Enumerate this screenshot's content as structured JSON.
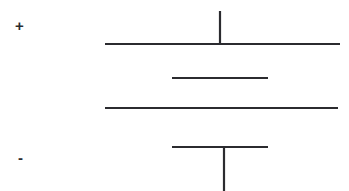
{
  "canvas": {
    "width": 349,
    "height": 191,
    "background_color": "#ffffff"
  },
  "diagram": {
    "stroke_color": "#2b2b2f",
    "labels": {
      "positive_terminal": "+",
      "negative_terminal": "-"
    }
  },
  "chart_data": {
    "type": "diagram",
    "title": "",
    "elements": [
      {
        "name": "top-lead-wire",
        "kind": "line",
        "orientation": "vertical",
        "x1": 220,
        "y1": 11,
        "x2": 220,
        "y2": 45,
        "stroke_width": 2.2,
        "color": "#2b2b2f"
      },
      {
        "name": "plate-long-upper",
        "kind": "line",
        "orientation": "horizontal",
        "x1": 105,
        "y1": 44,
        "x2": 340,
        "y2": 44,
        "stroke_width": 2.2,
        "color": "#2b2b2f"
      },
      {
        "name": "plate-short-upper",
        "kind": "line",
        "orientation": "horizontal",
        "x1": 172,
        "y1": 78,
        "x2": 268,
        "y2": 78,
        "stroke_width": 2.2,
        "color": "#2b2b2f"
      },
      {
        "name": "plate-long-lower",
        "kind": "line",
        "orientation": "horizontal",
        "x1": 105,
        "y1": 108,
        "x2": 338,
        "y2": 108,
        "stroke_width": 2.2,
        "color": "#2b2b2f"
      },
      {
        "name": "plate-short-lower",
        "kind": "line",
        "orientation": "horizontal",
        "x1": 172,
        "y1": 147,
        "x2": 268,
        "y2": 147,
        "stroke_width": 2.2,
        "color": "#2b2b2f"
      },
      {
        "name": "bottom-lead-wire",
        "kind": "line",
        "orientation": "vertical",
        "x1": 224,
        "y1": 147,
        "x2": 224,
        "y2": 191,
        "stroke_width": 2.2,
        "color": "#2b2b2f"
      }
    ],
    "annotations": [
      {
        "name": "positive-terminal-label",
        "text": "+",
        "x": 21,
        "y": 26
      },
      {
        "name": "negative-terminal-label",
        "text": "-",
        "x": 24,
        "y": 159
      }
    ]
  }
}
